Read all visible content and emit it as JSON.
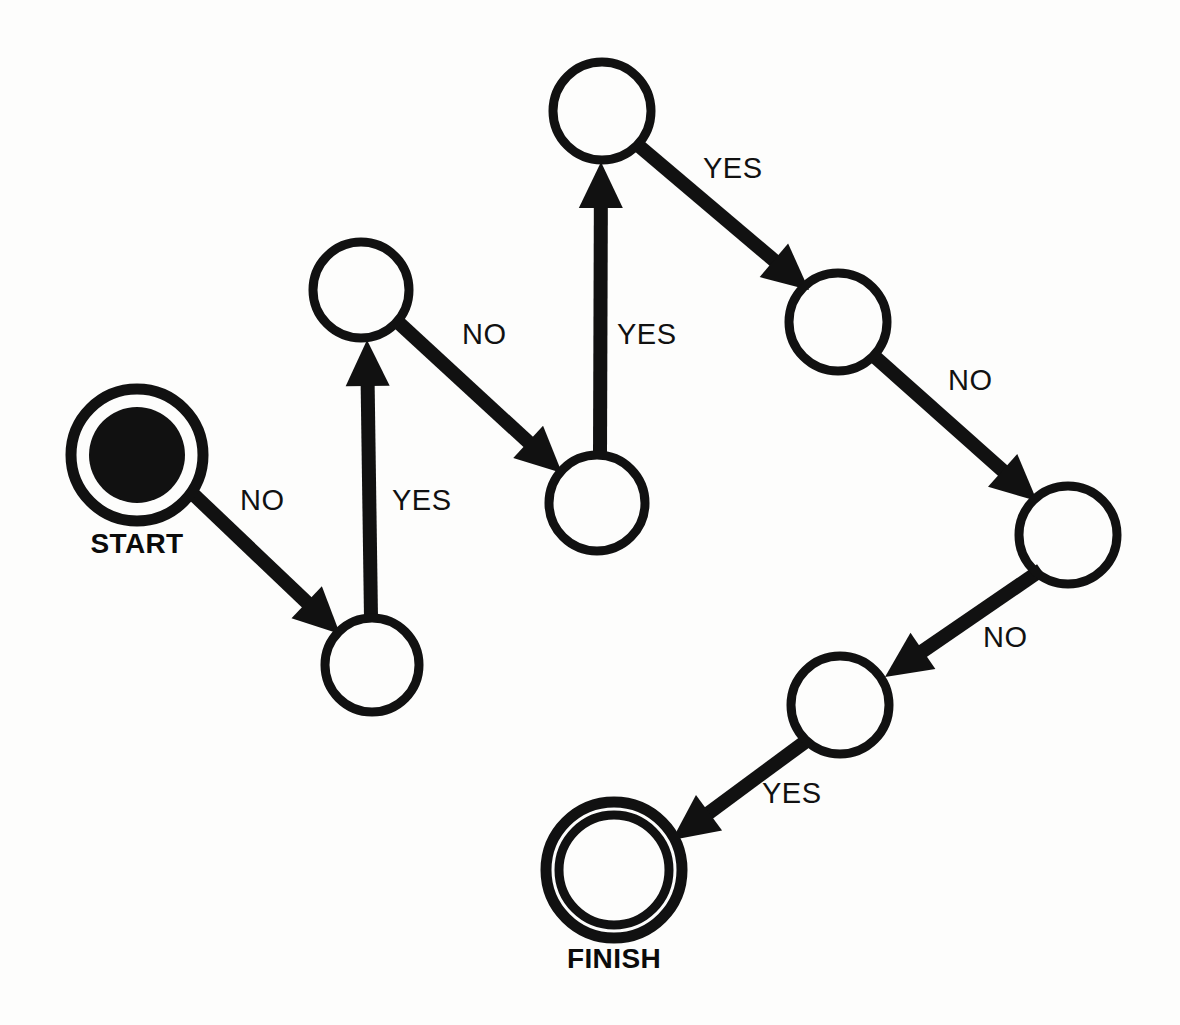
{
  "diagram": {
    "type": "flowchart",
    "background_color": "#fdfdfc",
    "ink_color": "#111111",
    "canvas": {
      "width": 1180,
      "height": 1025
    },
    "nodes": [
      {
        "id": "start",
        "label": "START",
        "shape": "double-circle-filled",
        "cx": 137,
        "cy": 455,
        "outer_r": 66,
        "inner_r": 48,
        "label_x": 137,
        "label_y": 553
      },
      {
        "id": "n2",
        "label": "",
        "shape": "circle",
        "cx": 372,
        "cy": 665,
        "outer_r": 47,
        "inner_r": 0,
        "label_x": 372,
        "label_y": 665
      },
      {
        "id": "n3",
        "label": "",
        "shape": "circle",
        "cx": 361,
        "cy": 290,
        "outer_r": 48,
        "inner_r": 0,
        "label_x": 361,
        "label_y": 290
      },
      {
        "id": "n4",
        "label": "",
        "shape": "circle",
        "cx": 597,
        "cy": 503,
        "outer_r": 48,
        "inner_r": 0,
        "label_x": 597,
        "label_y": 503
      },
      {
        "id": "n5",
        "label": "",
        "shape": "circle",
        "cx": 602,
        "cy": 111,
        "outer_r": 49,
        "inner_r": 0,
        "label_x": 602,
        "label_y": 111
      },
      {
        "id": "n6",
        "label": "",
        "shape": "circle",
        "cx": 838,
        "cy": 322,
        "outer_r": 49,
        "inner_r": 0,
        "label_x": 838,
        "label_y": 322
      },
      {
        "id": "n7",
        "label": "",
        "shape": "circle",
        "cx": 1068,
        "cy": 535,
        "outer_r": 49,
        "inner_r": 0,
        "label_x": 1068,
        "label_y": 535
      },
      {
        "id": "n8",
        "label": "",
        "shape": "circle",
        "cx": 840,
        "cy": 705,
        "outer_r": 49,
        "inner_r": 0,
        "label_x": 840,
        "label_y": 705
      },
      {
        "id": "finish",
        "label": "FINISH",
        "shape": "double-circle",
        "cx": 614,
        "cy": 870,
        "outer_r": 68,
        "inner_r": 55,
        "label_x": 614,
        "label_y": 968
      }
    ],
    "edges": [
      {
        "id": "start-to-n2",
        "from": "start",
        "to": "n2",
        "label": "NO",
        "x1": 192,
        "y1": 493,
        "x2": 340,
        "y2": 634,
        "label_x": 240,
        "label_y": 502
      },
      {
        "id": "n2-to-n3",
        "from": "n2",
        "to": "n3",
        "label": "YES",
        "x1": 371,
        "y1": 618,
        "x2": 367,
        "y2": 340,
        "label_x": 392,
        "label_y": 502
      },
      {
        "id": "n3-to-n4",
        "from": "n3",
        "to": "n4",
        "label": "NO",
        "x1": 399,
        "y1": 323,
        "x2": 562,
        "y2": 473,
        "label_x": 462,
        "label_y": 336
      },
      {
        "id": "n4-to-n5",
        "from": "n4",
        "to": "n5",
        "label": "YES",
        "x1": 600,
        "y1": 455,
        "x2": 601,
        "y2": 162,
        "label_x": 617,
        "label_y": 336
      },
      {
        "id": "n5-to-n6",
        "from": "n5",
        "to": "n6",
        "label": "YES",
        "x1": 639,
        "y1": 146,
        "x2": 809,
        "y2": 290,
        "label_x": 703,
        "label_y": 170
      },
      {
        "id": "n6-to-n7",
        "from": "n6",
        "to": "n7",
        "label": "NO",
        "x1": 874,
        "y1": 356,
        "x2": 1037,
        "y2": 501,
        "label_x": 948,
        "label_y": 382
      },
      {
        "id": "n7-to-n8",
        "from": "n7",
        "to": "n8",
        "label": "NO",
        "x1": 1041,
        "y1": 570,
        "x2": 885,
        "y2": 677,
        "label_x": 983,
        "label_y": 639
      },
      {
        "id": "n8-to-finish",
        "from": "n8",
        "to": "finish",
        "label": "YES",
        "x1": 809,
        "y1": 739,
        "x2": 672,
        "y2": 840,
        "label_x": 762,
        "label_y": 795
      }
    ],
    "legend": {
      "yes_label": "YES",
      "no_label": "NO"
    }
  }
}
